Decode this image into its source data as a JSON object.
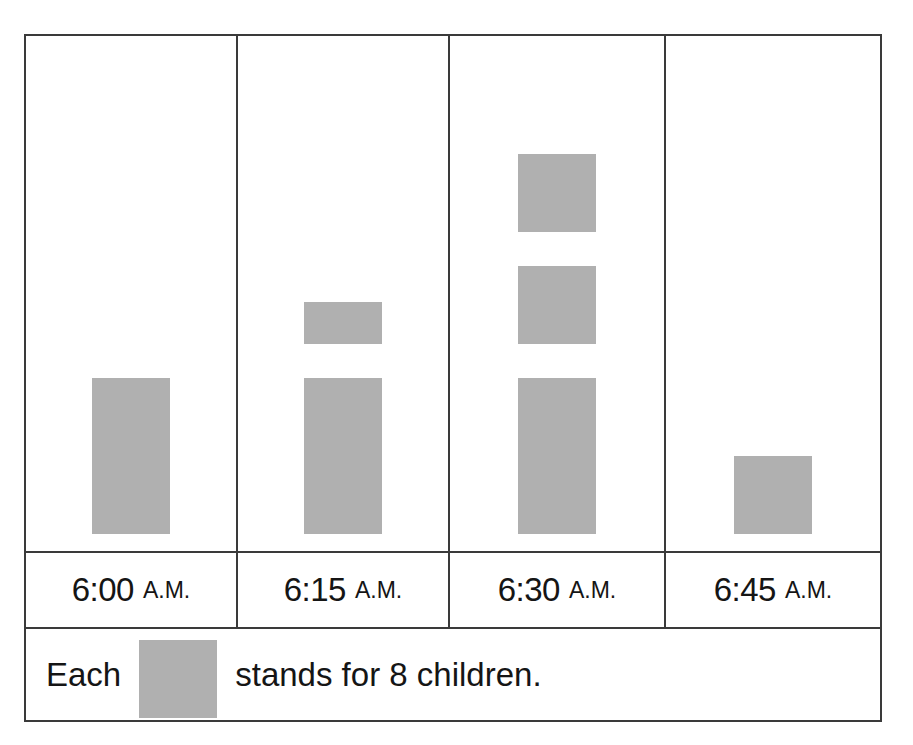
{
  "chart_data": {
    "type": "pictograph",
    "title": "",
    "xlabel": "",
    "ylabel": "",
    "symbol_name": "gray-square",
    "symbol_color": "#b0b0b0",
    "symbol_value": 8,
    "unit": "children",
    "legend": {
      "prefix": "Each",
      "suffix": "stands for 8 children.",
      "full_text": "Each  stands for 8 children."
    },
    "categories": [
      "6:00 A.M.",
      "6:15 A.M.",
      "6:30 A.M.",
      "6:45 A.M."
    ],
    "values": [
      16,
      20,
      32,
      8
    ],
    "symbol_counts": [
      2,
      2.5,
      4,
      1
    ],
    "columns": [
      {
        "time": "6:00",
        "meridiem": "A.M.",
        "label": "6:00 A.M.",
        "full_symbols": 2,
        "half_symbols": 0,
        "symbol_count": 2,
        "value": 16,
        "width_px": 212
      },
      {
        "time": "6:15",
        "meridiem": "A.M.",
        "label": "6:15 A.M.",
        "full_symbols": 2,
        "half_symbols": 1,
        "symbol_count": 2.5,
        "value": 20,
        "width_px": 212
      },
      {
        "time": "6:30",
        "meridiem": "A.M.",
        "label": "6:30 A.M.",
        "full_symbols": 4,
        "half_symbols": 0,
        "symbol_count": 4,
        "value": 32,
        "width_px": 216
      },
      {
        "time": "6:45",
        "meridiem": "A.M.",
        "label": "6:45 A.M.",
        "full_symbols": 1,
        "half_symbols": 0,
        "symbol_count": 1,
        "value": 8,
        "width_px": 214
      }
    ],
    "grid": false,
    "legend_position": "bottom"
  },
  "colors": {
    "symbol_fill": "#b0b0b0",
    "border": "#3a3a3a",
    "text": "#151515",
    "background": "#ffffff"
  }
}
